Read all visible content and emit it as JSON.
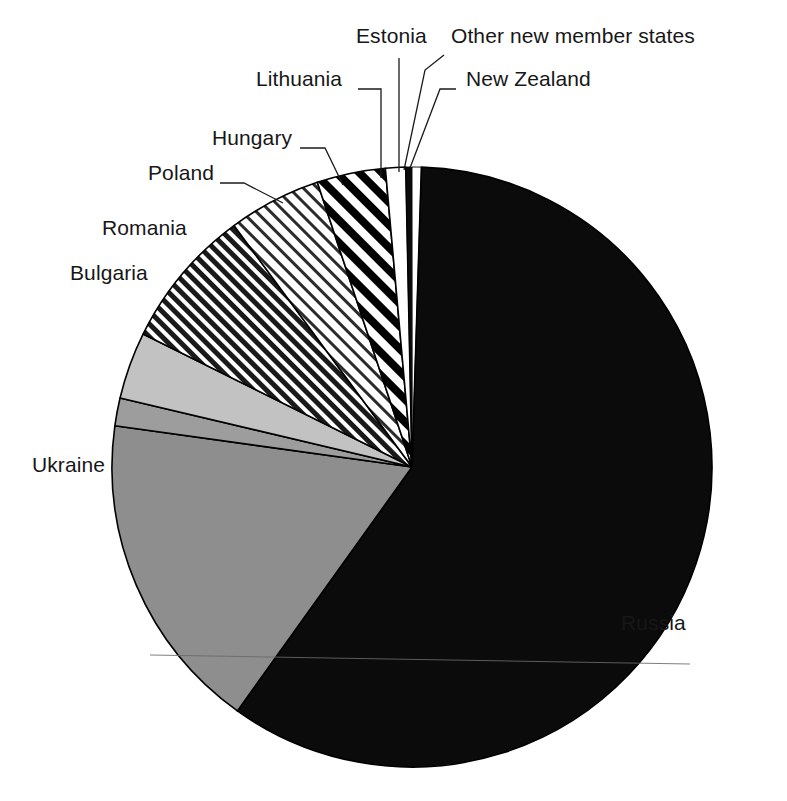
{
  "chart_data": {
    "type": "pie",
    "title": "",
    "subtitle": "",
    "xlabel": "",
    "ylabel": "",
    "legend_position": "callout-labels",
    "grid": false,
    "center": {
      "x": 412,
      "y": 467
    },
    "radius": 300,
    "start_angle_deg": -90,
    "direction": "clockwise",
    "categories": [
      "New Zealand",
      "Russia",
      "Ukraine",
      "Bulgaria",
      "Romania",
      "Poland",
      "Hungary",
      "Lithuania",
      "Estonia",
      "Other new member states"
    ],
    "values": [
      0.5,
      59.4,
      17.3,
      1.5,
      3.6,
      7.6,
      5.0,
      3.7,
      1.1,
      0.3
    ],
    "slices": [
      {
        "label": "New Zealand",
        "value": 0.5,
        "start_deg": -90.0,
        "end_deg": -88.2,
        "fill": "white",
        "fill_hex": "#ffffff",
        "stroke_hex": "#000000"
      },
      {
        "label": "Russia",
        "value": 59.4,
        "start_deg": -88.2,
        "end_deg": 125.6,
        "fill": "solid-black",
        "fill_hex": "#0b0b0b",
        "stroke_hex": "#000000"
      },
      {
        "label": "Ukraine",
        "value": 17.3,
        "start_deg": 125.6,
        "end_deg": 187.9,
        "fill": "solid-mid-gray",
        "fill_hex": "#8e8e8e",
        "stroke_hex": "#000000"
      },
      {
        "label": "Bulgaria",
        "value": 1.5,
        "start_deg": 187.9,
        "end_deg": 193.3,
        "fill": "solid-gray",
        "fill_hex": "#9d9d9d",
        "stroke_hex": "#000000"
      },
      {
        "label": "Romania",
        "value": 3.6,
        "start_deg": 193.3,
        "end_deg": 206.3,
        "fill": "solid-light-gray",
        "fill_hex": "#c2c2c2",
        "stroke_hex": "#000000"
      },
      {
        "label": "Poland",
        "value": 7.6,
        "start_deg": 206.3,
        "end_deg": 233.6,
        "fill": "dense-diagonal-hatch",
        "fill_hex": "#6f6f6f",
        "stroke_hex": "#000000"
      },
      {
        "label": "Hungary",
        "value": 5.0,
        "start_deg": 233.6,
        "end_deg": 251.6,
        "fill": "light-diagonal-hatch",
        "fill_hex": "#cfcfcf",
        "stroke_hex": "#000000"
      },
      {
        "label": "Lithuania",
        "value": 3.7,
        "start_deg": 251.6,
        "end_deg": 264.9,
        "fill": "bold-diagonal-hatch",
        "fill_hex": "#000000",
        "stroke_hex": "#000000"
      },
      {
        "label": "Estonia",
        "value": 1.1,
        "start_deg": 264.9,
        "end_deg": 268.8,
        "fill": "white",
        "fill_hex": "#ffffff",
        "stroke_hex": "#000000"
      },
      {
        "label": "Other new member states",
        "value": 0.3,
        "start_deg": 268.8,
        "end_deg": 269.9,
        "fill": "solid-black",
        "fill_hex": "#000000",
        "stroke_hex": "#000000"
      }
    ],
    "annotations": [
      {
        "text": "Estonia",
        "x": 356,
        "y": 35,
        "anchor": "start",
        "leader": [
          [
            399,
            58
          ],
          [
            399,
            172
          ]
        ]
      },
      {
        "text": "Other new member states",
        "x": 451,
        "y": 35,
        "anchor": "start",
        "leader": [
          [
            444,
            55
          ],
          [
            425,
            70
          ],
          [
            404,
            170
          ]
        ]
      },
      {
        "text": "Lithuania",
        "x": 256,
        "y": 78,
        "anchor": "start",
        "leader": [
          [
            358,
            89
          ],
          [
            381,
            89
          ],
          [
            381,
            178
          ]
        ]
      },
      {
        "text": "New Zealand",
        "x": 466,
        "y": 78,
        "anchor": "start",
        "leader": [
          [
            456,
            89
          ],
          [
            440,
            89
          ],
          [
            410,
            168
          ]
        ]
      },
      {
        "text": "Hungary",
        "x": 212,
        "y": 137,
        "anchor": "start",
        "leader": [
          [
            300,
            148
          ],
          [
            325,
            148
          ],
          [
            343,
            185
          ]
        ]
      },
      {
        "text": "Poland",
        "x": 148,
        "y": 172,
        "anchor": "start",
        "leader": [
          [
            220,
            183
          ],
          [
            244,
            183
          ],
          [
            283,
            203
          ]
        ]
      },
      {
        "text": "Romania",
        "x": 102,
        "y": 227,
        "anchor": "start",
        "leader": []
      },
      {
        "text": "Bulgaria",
        "x": 70,
        "y": 272,
        "anchor": "start",
        "leader": []
      },
      {
        "text": "Ukraine",
        "x": 32,
        "y": 464,
        "anchor": "start",
        "leader": []
      },
      {
        "text": "Russia",
        "x": 689,
        "y": 622,
        "anchor": "end",
        "leader": []
      }
    ]
  },
  "labels": {
    "estonia": "Estonia",
    "other_new_member_states": "Other new member states",
    "lithuania": "Lithuania",
    "new_zealand": "New Zealand",
    "hungary": "Hungary",
    "poland": "Poland",
    "romania": "Romania",
    "bulgaria": "Bulgaria",
    "ukraine": "Ukraine",
    "russia": "Russia"
  },
  "colors": {
    "background": "#ffffff",
    "text": "#171717",
    "outline": "#000000",
    "russia_fill": "#0b0b0b",
    "ukraine_fill": "#8e8e8e",
    "bulgaria_fill": "#9d9d9d",
    "romania_fill": "#c2c2c2",
    "hatch_dark": "#6f6f6f",
    "hatch_light": "#cfcfcf"
  }
}
